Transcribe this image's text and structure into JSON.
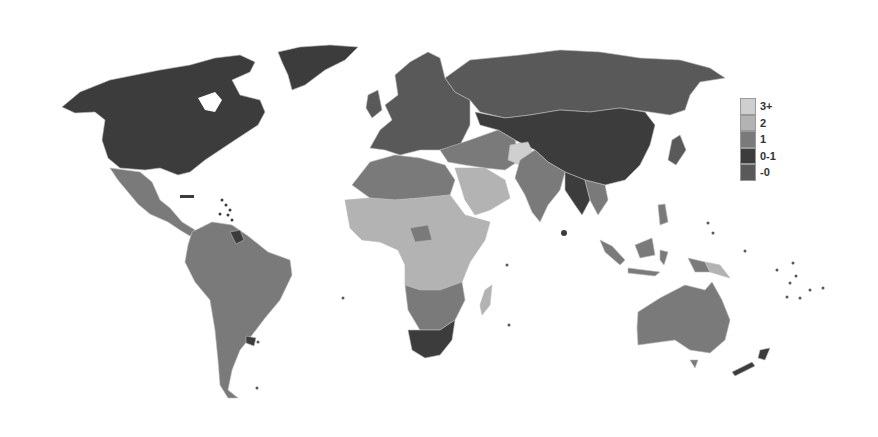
{
  "map": {
    "type": "choropleth-world",
    "background": "#ffffff",
    "border_color": "#b8b8b8"
  },
  "legend": {
    "items": [
      {
        "label": "3+",
        "color": "#cfcfcf"
      },
      {
        "label": "2",
        "color": "#b3b3b3"
      },
      {
        "label": "1",
        "color": "#7a7a7a"
      },
      {
        "label": "0-1",
        "color": "#3c3c3c"
      },
      {
        "label": "-0",
        "color": "#595959"
      }
    ]
  },
  "regions": {
    "north_america": {
      "category": "0-1"
    },
    "greenland": {
      "category": "0-1"
    },
    "mexico_central_america": {
      "category": "1"
    },
    "south_america": {
      "category": "1"
    },
    "europe": {
      "category": "-0"
    },
    "russia": {
      "category": "-0"
    },
    "china_mongolia_kazakhstan": {
      "category": "0-1"
    },
    "middle_east": {
      "category": "1"
    },
    "afghanistan": {
      "category": "3+"
    },
    "arabian_peninsula": {
      "category": "2"
    },
    "north_africa": {
      "category": "1"
    },
    "sub_saharan_africa": {
      "category": "2"
    },
    "southern_africa": {
      "category": "1"
    },
    "south_africa": {
      "category": "0-1"
    },
    "south_asia": {
      "category": "1"
    },
    "southeast_asia": {
      "category": "1"
    },
    "australia": {
      "category": "1"
    },
    "new_zealand": {
      "category": "0-1"
    },
    "japan": {
      "category": "-0"
    },
    "madagascar": {
      "category": "2"
    },
    "papua_new_guinea": {
      "category": "2"
    }
  }
}
